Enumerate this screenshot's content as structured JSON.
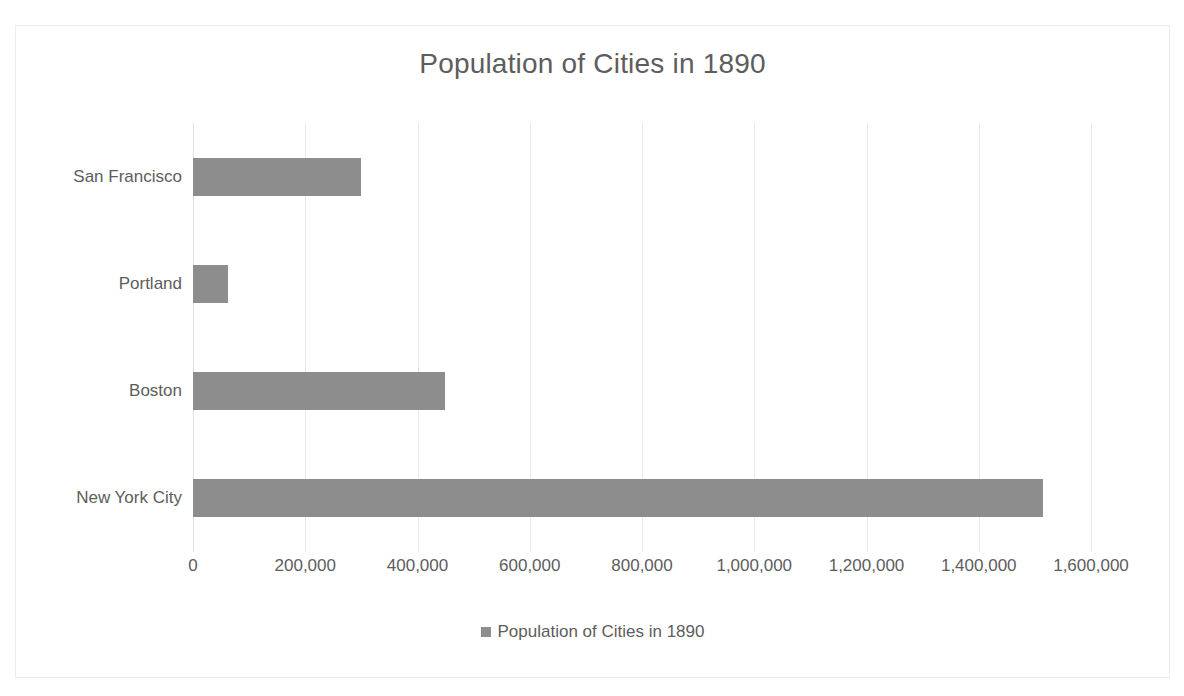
{
  "chart_data": {
    "type": "bar",
    "orientation": "horizontal",
    "title": "Population of Cities in 1890",
    "xlabel": "",
    "ylabel": "",
    "categories": [
      "New York City",
      "Boston",
      "Portland",
      "San Francisco"
    ],
    "values": [
      1515301,
      448477,
      62046,
      298997
    ],
    "display_order_top_to_bottom": [
      "San Francisco",
      "Portland",
      "Boston",
      "New York City"
    ],
    "xlim": [
      0,
      1600000
    ],
    "xtick_values": [
      0,
      200000,
      400000,
      600000,
      800000,
      1000000,
      1200000,
      1400000,
      1600000
    ],
    "xtick_labels": [
      "0",
      "200,000",
      "400,000",
      "600,000",
      "800,000",
      "1,000,000",
      "1,200,000",
      "1,400,000",
      "1,600,000"
    ],
    "grid": true,
    "grid_axis": "x",
    "legend": {
      "position": "bottom",
      "entries": [
        {
          "label": "Population of Cities in 1890",
          "color": "#8d8d8d",
          "marker": "square"
        }
      ]
    },
    "series": [
      {
        "name": "Population of Cities in 1890",
        "color": "#8d8d8d",
        "values": [
          1515301,
          448477,
          62046,
          298997
        ]
      }
    ],
    "colors": {
      "bar": "#8d8d8d",
      "text": "#5d5d5d",
      "gridline": "#e9e9e9",
      "frame": "#ededed",
      "background": "#ffffff"
    }
  },
  "bars": [
    {
      "label": "San Francisco",
      "value": 298997
    },
    {
      "label": "Portland",
      "value": 62046
    },
    {
      "label": "Boston",
      "value": 448477
    },
    {
      "label": "New York City",
      "value": 1515301
    }
  ]
}
